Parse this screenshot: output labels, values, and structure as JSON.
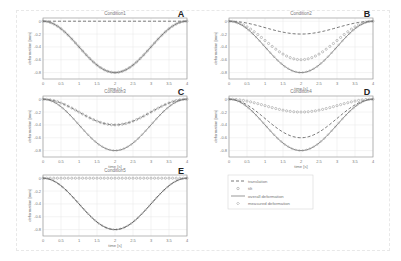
{
  "figure": {
    "legend": {
      "entries": [
        {
          "label": "translation",
          "style": "dashed"
        },
        {
          "label": "tilt",
          "style": "circle-marker"
        },
        {
          "label": "overall deformation",
          "style": "solid"
        },
        {
          "label": "measured deformation",
          "style": "diamond-marker"
        }
      ]
    }
  },
  "chart_data": [
    {
      "type": "line",
      "panel": "A",
      "title": "Condition1",
      "xlabel": "time [s]",
      "ylabel": "deformation [mm]",
      "xlim": [
        0,
        4
      ],
      "ylim": [
        -0.9,
        0.05
      ],
      "xticks": [
        0,
        0.5,
        1,
        1.5,
        2,
        2.5,
        3,
        3.5,
        4
      ],
      "yticks": [
        0,
        -0.2,
        -0.4,
        -0.6,
        -0.8
      ],
      "grid": true,
      "series": [
        {
          "name": "translation",
          "min": 0.0
        },
        {
          "name": "tilt",
          "min": -0.8
        },
        {
          "name": "overall deformation",
          "min": -0.8
        },
        {
          "name": "measured deformation",
          "min": -0.8
        }
      ]
    },
    {
      "type": "line",
      "panel": "B",
      "title": "Condition2",
      "xlabel": "time [s]",
      "ylabel": "deformation [mm]",
      "xlim": [
        0,
        4
      ],
      "ylim": [
        -0.9,
        0.05
      ],
      "xticks": [
        0,
        0.5,
        1,
        1.5,
        2,
        2.5,
        3,
        3.5,
        4
      ],
      "yticks": [
        0,
        -0.2,
        -0.4,
        -0.6,
        -0.8
      ],
      "grid": true,
      "series": [
        {
          "name": "translation",
          "min": -0.2
        },
        {
          "name": "tilt",
          "min": -0.6
        },
        {
          "name": "overall deformation",
          "min": -0.8
        },
        {
          "name": "measured deformation",
          "min": -0.8
        }
      ]
    },
    {
      "type": "line",
      "panel": "C",
      "title": "Condition3",
      "xlabel": "time [s]",
      "ylabel": "deformation [mm]",
      "xlim": [
        0,
        4
      ],
      "ylim": [
        -0.9,
        0.05
      ],
      "xticks": [
        0,
        0.5,
        1,
        1.5,
        2,
        2.5,
        3,
        3.5,
        4
      ],
      "yticks": [
        0,
        -0.2,
        -0.4,
        -0.6,
        -0.8
      ],
      "grid": true,
      "series": [
        {
          "name": "translation",
          "min": -0.4
        },
        {
          "name": "tilt",
          "min": -0.4
        },
        {
          "name": "overall deformation",
          "min": -0.8
        },
        {
          "name": "measured deformation",
          "min": -0.8
        }
      ]
    },
    {
      "type": "line",
      "panel": "D",
      "title": "Condition4",
      "xlabel": "time [s]",
      "ylabel": "deformation [mm]",
      "xlim": [
        0,
        4
      ],
      "ylim": [
        -0.9,
        0.05
      ],
      "xticks": [
        0,
        0.5,
        1,
        1.5,
        2,
        2.5,
        3,
        3.5,
        4
      ],
      "yticks": [
        0,
        -0.2,
        -0.4,
        -0.6,
        -0.8
      ],
      "grid": true,
      "series": [
        {
          "name": "translation",
          "min": -0.6
        },
        {
          "name": "tilt",
          "min": -0.2
        },
        {
          "name": "overall deformation",
          "min": -0.8
        },
        {
          "name": "measured deformation",
          "min": -0.8
        }
      ]
    },
    {
      "type": "line",
      "panel": "E",
      "title": "Condition5",
      "xlabel": "time [s]",
      "ylabel": "deformation [mm]",
      "xlim": [
        0,
        4
      ],
      "ylim": [
        -0.9,
        0.05
      ],
      "xticks": [
        0,
        0.5,
        1,
        1.5,
        2,
        2.5,
        3,
        3.5,
        4
      ],
      "yticks": [
        0,
        -0.2,
        -0.4,
        -0.6,
        -0.8
      ],
      "grid": true,
      "series": [
        {
          "name": "translation",
          "min": -0.8
        },
        {
          "name": "tilt",
          "min": 0.0
        },
        {
          "name": "overall deformation",
          "min": -0.8
        },
        {
          "name": "measured deformation",
          "min": -0.8
        }
      ]
    }
  ],
  "panels": [
    {
      "letter": "A",
      "title": "Condition1",
      "x": 43,
      "y": 18
    },
    {
      "letter": "B",
      "title": "Condition2",
      "x": 229,
      "y": 18
    },
    {
      "letter": "C",
      "title": "Condition3",
      "x": 43,
      "y": 96
    },
    {
      "letter": "D",
      "title": "Condition4",
      "x": 229,
      "y": 96
    },
    {
      "letter": "E",
      "title": "Condition5",
      "x": 43,
      "y": 175
    }
  ],
  "axis": {
    "xlabel": "time [s]",
    "ylabel": "deformation [mm]",
    "xtick_labels": [
      "0",
      "0.5",
      "1",
      "1.5",
      "2",
      "2.5",
      "3",
      "3.5",
      "4"
    ],
    "ytick_labels": [
      "0",
      "-0.2",
      "-0.4",
      "-0.6",
      "-0.8"
    ]
  },
  "colors": {
    "frame": "#9a9a9a",
    "grid": "#e6e6e6",
    "line": "#555555",
    "marker": "#8a8a8a",
    "text": "#777777",
    "letter": "#222222"
  }
}
